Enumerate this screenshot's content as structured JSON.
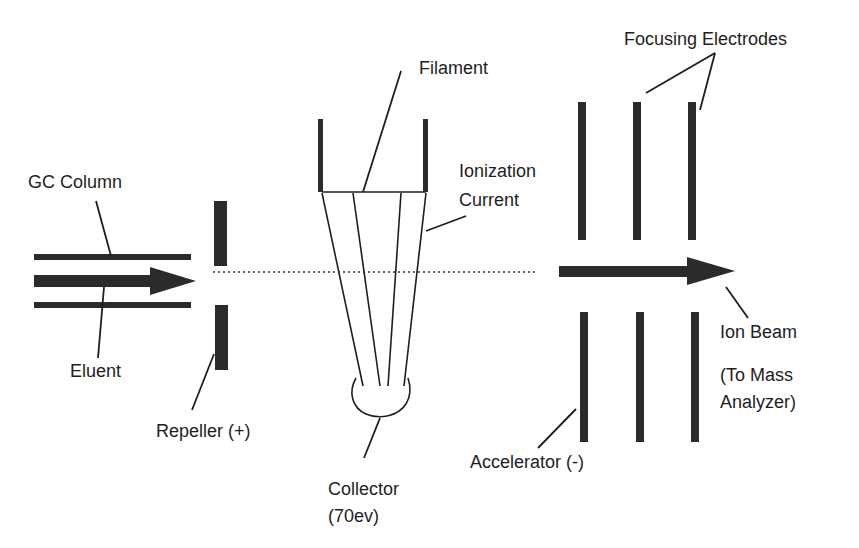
{
  "diagram": {
    "type": "electron-ionization-source-schematic",
    "labels": {
      "gc_column": "GC Column",
      "eluent": "Eluent",
      "repeller": "Repeller (+)",
      "filament": "Filament",
      "ionization_current_line1": "Ionization",
      "ionization_current_line2": "Current",
      "collector_line1": "Collector",
      "collector_line2": "(70ev)",
      "focusing_electrodes": "Focusing Electrodes",
      "accelerator": "Accelerator (-)",
      "ion_beam": "Ion Beam",
      "destination_line1": "(To Mass",
      "destination_line2": "Analyzer)"
    },
    "components": [
      {
        "id": "gc-column",
        "kind": "tube",
        "label_ref": "gc_column"
      },
      {
        "id": "eluent-arrow",
        "kind": "arrow",
        "direction": "right",
        "label_ref": "eluent"
      },
      {
        "id": "repeller",
        "kind": "plate-pair",
        "polarity": "+",
        "label_ref": "repeller"
      },
      {
        "id": "filament",
        "kind": "filament",
        "label_ref": "filament"
      },
      {
        "id": "ionization-current",
        "kind": "electron-paths",
        "count": 4,
        "label_ref": "ionization_current_line1"
      },
      {
        "id": "collector",
        "kind": "cup",
        "energy": "70ev",
        "label_ref": "collector_line1"
      },
      {
        "id": "accelerator",
        "kind": "plate-pair",
        "polarity": "-",
        "label_ref": "accelerator"
      },
      {
        "id": "focusing-electrodes",
        "kind": "plate-pairs",
        "count": 2,
        "label_ref": "focusing_electrodes"
      },
      {
        "id": "ion-beam",
        "kind": "arrow",
        "direction": "right",
        "label_ref": "ion_beam"
      }
    ],
    "colors": {
      "ink": "#1e1e1e",
      "bar": "#2b2b2b",
      "background": "#ffffff"
    }
  }
}
